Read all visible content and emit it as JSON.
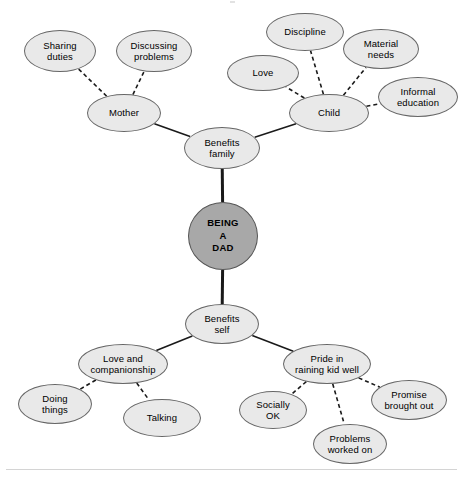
{
  "diagram": {
    "type": "mind-map",
    "central_node": {
      "id": "being-a-dad",
      "label": "BEING\nA\nDAD",
      "shape": "circle",
      "fill": "#a8a8a8",
      "stroke": "#555555",
      "cx": 223,
      "cy": 236,
      "rx": 35,
      "ry": 34
    },
    "palette": {
      "node_fill": "#e9e9e9",
      "node_stroke": "#666666",
      "central_fill": "#a8a8a8",
      "edge_color": "#1a1a1a",
      "background": "#ffffff",
      "rule_color": "#d4d4d4"
    },
    "nodes": [
      {
        "id": "benefits-family",
        "label": "Benefits\nfamily",
        "cx": 222,
        "cy": 148,
        "rx": 38,
        "ry": 21,
        "level": 1
      },
      {
        "id": "benefits-self",
        "label": "Benefits\nself",
        "cx": 222,
        "cy": 324,
        "rx": 37,
        "ry": 20,
        "level": 1
      },
      {
        "id": "mother",
        "label": "Mother",
        "cx": 124,
        "cy": 113,
        "rx": 37,
        "ry": 19,
        "level": 2
      },
      {
        "id": "child",
        "label": "Child",
        "cx": 329,
        "cy": 113,
        "rx": 40,
        "ry": 19,
        "level": 2
      },
      {
        "id": "sharing-duties",
        "label": "Sharing\nduties",
        "cx": 60,
        "cy": 51,
        "rx": 36,
        "ry": 21,
        "level": 3
      },
      {
        "id": "discussing-problems",
        "label": "Discussing\nproblems",
        "cx": 154,
        "cy": 51,
        "rx": 38,
        "ry": 21,
        "level": 3
      },
      {
        "id": "love",
        "label": "Love",
        "cx": 263,
        "cy": 73,
        "rx": 36,
        "ry": 18,
        "level": 3
      },
      {
        "id": "discipline",
        "label": "Discipline",
        "cx": 305,
        "cy": 32,
        "rx": 39,
        "ry": 19,
        "level": 3
      },
      {
        "id": "material-needs",
        "label": "Material\nneeds",
        "cx": 381,
        "cy": 49,
        "rx": 38,
        "ry": 20,
        "level": 3
      },
      {
        "id": "informal-education",
        "label": "Informal\neducation",
        "cx": 418,
        "cy": 97,
        "rx": 40,
        "ry": 20,
        "level": 3
      },
      {
        "id": "love-and-companionship",
        "label": "Love and\ncompanionship",
        "cx": 123,
        "cy": 364,
        "rx": 45,
        "ry": 20,
        "level": 2
      },
      {
        "id": "pride-in-raining-kid-well",
        "label": "Pride in\nraining kid well",
        "cx": 327,
        "cy": 364,
        "rx": 44,
        "ry": 20,
        "level": 2
      },
      {
        "id": "doing-things",
        "label": "Doing\nthings",
        "cx": 55,
        "cy": 404,
        "rx": 37,
        "ry": 20,
        "level": 3
      },
      {
        "id": "talking",
        "label": "Talking",
        "cx": 162,
        "cy": 418,
        "rx": 39,
        "ry": 19,
        "level": 3
      },
      {
        "id": "socially-ok",
        "label": "Socially\nOK",
        "cx": 273,
        "cy": 410,
        "rx": 34,
        "ry": 19,
        "level": 3
      },
      {
        "id": "problems-worked-on",
        "label": "Problems\nworked on",
        "cx": 350,
        "cy": 444,
        "rx": 37,
        "ry": 20,
        "level": 3
      },
      {
        "id": "promise-brought-out",
        "label": "Promise\nbrought out",
        "cx": 409,
        "cy": 400,
        "rx": 38,
        "ry": 20,
        "level": 3
      }
    ],
    "edges": [
      {
        "from": "being-a-dad",
        "to": "benefits-family",
        "style": "solid",
        "width": 3
      },
      {
        "from": "being-a-dad",
        "to": "benefits-self",
        "style": "solid",
        "width": 3
      },
      {
        "from": "benefits-family",
        "to": "mother",
        "style": "solid",
        "width": 1.6
      },
      {
        "from": "benefits-family",
        "to": "child",
        "style": "solid",
        "width": 1.6
      },
      {
        "from": "mother",
        "to": "sharing-duties",
        "style": "dashed",
        "width": 1.6
      },
      {
        "from": "mother",
        "to": "discussing-problems",
        "style": "dashed",
        "width": 1.6
      },
      {
        "from": "child",
        "to": "love",
        "style": "dashed",
        "width": 1.6
      },
      {
        "from": "child",
        "to": "discipline",
        "style": "dashed",
        "width": 1.6
      },
      {
        "from": "child",
        "to": "material-needs",
        "style": "dashed",
        "width": 1.6
      },
      {
        "from": "child",
        "to": "informal-education",
        "style": "dashed",
        "width": 1.6
      },
      {
        "from": "benefits-self",
        "to": "love-and-companionship",
        "style": "solid",
        "width": 1.6
      },
      {
        "from": "benefits-self",
        "to": "pride-in-raining-kid-well",
        "style": "solid",
        "width": 1.6
      },
      {
        "from": "love-and-companionship",
        "to": "doing-things",
        "style": "dashed",
        "width": 1.6
      },
      {
        "from": "love-and-companionship",
        "to": "talking",
        "style": "dashed",
        "width": 1.6
      },
      {
        "from": "pride-in-raining-kid-well",
        "to": "socially-ok",
        "style": "dashed",
        "width": 1.6
      },
      {
        "from": "pride-in-raining-kid-well",
        "to": "problems-worked-on",
        "style": "dashed",
        "width": 1.6
      },
      {
        "from": "pride-in-raining-kid-well",
        "to": "promise-brought-out",
        "style": "dashed",
        "width": 1.6
      }
    ]
  }
}
